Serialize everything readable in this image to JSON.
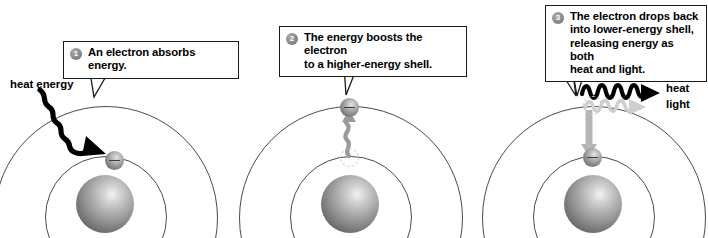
{
  "figure": {
    "background_color": "#ffffff",
    "panel_count": 3
  },
  "panels": [
    {
      "id": "panel-1",
      "step_number": "1",
      "callout_text": "An electron absorbs energy.",
      "labels": [
        {
          "name": "heat-energy-label",
          "text": "heat energy"
        }
      ],
      "atom": {
        "nucleus": "nucleus",
        "shells": [
          "inner-shell",
          "outer-shell"
        ],
        "electron_position": "inner-shell",
        "ghost_electron": false
      },
      "arrow": {
        "name": "heat-energy-wave-arrow",
        "style": "wavy",
        "color": "#000000",
        "direction": "down-right-into-inner-shell"
      }
    },
    {
      "id": "panel-2",
      "step_number": "2",
      "callout_text": "The energy boosts the electron\nto a higher-energy shell.",
      "labels": [],
      "atom": {
        "nucleus": "nucleus",
        "shells": [
          "inner-shell",
          "outer-shell"
        ],
        "electron_position": "outer-shell",
        "ghost_electron": true
      },
      "arrow": {
        "name": "energy-boost-wave-arrow",
        "style": "wavy",
        "color": "#9a9a9a",
        "direction": "up"
      }
    },
    {
      "id": "panel-3",
      "step_number": "3",
      "callout_text": "The electron drops back\ninto lower-energy shell,\nreleasing energy as both\nheat and light.",
      "labels": [
        {
          "name": "heat-label",
          "text": "heat"
        },
        {
          "name": "light-label",
          "text": "light"
        }
      ],
      "atom": {
        "nucleus": "nucleus",
        "shells": [
          "inner-shell",
          "outer-shell"
        ],
        "electron_position": "inner-shell",
        "ghost_electron": true
      },
      "arrow": {
        "name": "electron-drop-arrow",
        "style": "straight",
        "color": "#b5b5b5",
        "direction": "down"
      },
      "emission_waves": [
        {
          "name": "heat-wave",
          "color": "#000000",
          "label": "heat"
        },
        {
          "name": "light-wave",
          "color": "#cfcfcf",
          "label": "light"
        }
      ]
    }
  ],
  "colors": {
    "nucleus_dark": "#414141",
    "nucleus_light": "#f2f2f2",
    "shell_stroke": "#4a4a4a",
    "callout_border": "#1a1a1a",
    "badge_gray": "#8a8a8a",
    "heat_wave": "#000000",
    "light_wave": "#cfcfcf",
    "boost_wave": "#9a9a9a",
    "drop_arrow": "#b5b5b5"
  }
}
